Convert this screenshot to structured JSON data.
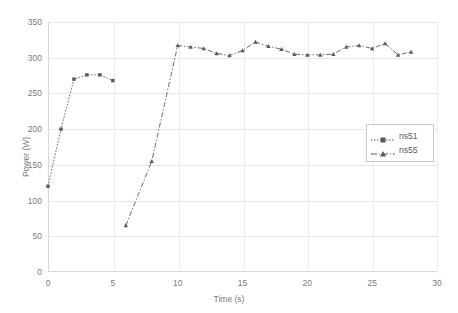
{
  "chart_data": {
    "type": "line",
    "title": "",
    "xlabel": "Time (s)",
    "ylabel": "Power (W)",
    "xlim": [
      0,
      30
    ],
    "ylim": [
      0,
      350
    ],
    "xticks": [
      0,
      5,
      10,
      15,
      20,
      25,
      30
    ],
    "yticks": [
      0,
      50,
      100,
      150,
      200,
      250,
      300,
      350
    ],
    "grid": true,
    "legend_position": "center-right",
    "series": [
      {
        "name": "ns51",
        "color": "#595959",
        "linestyle": "dotted",
        "marker": "square",
        "x": [
          0,
          1,
          2,
          3,
          4,
          5
        ],
        "values": [
          120,
          200,
          270,
          276,
          276,
          268
        ]
      },
      {
        "name": "ns55",
        "color": "#595959",
        "linestyle": "dash-dot",
        "marker": "triangle",
        "x": [
          6,
          8,
          10,
          11,
          12,
          13,
          14,
          15,
          16,
          17,
          18,
          19,
          20,
          21,
          22,
          23,
          24,
          25,
          26,
          27,
          28
        ],
        "values": [
          65,
          155,
          317,
          315,
          313,
          306,
          303,
          310,
          322,
          316,
          312,
          305,
          304,
          304,
          305,
          315,
          317,
          313,
          320,
          304,
          308
        ]
      }
    ]
  },
  "axes": {
    "yticks_labels": [
      "0",
      "50",
      "100",
      "150",
      "200",
      "250",
      "300",
      "350"
    ],
    "xticks_labels": [
      "0",
      "5",
      "10",
      "15",
      "20",
      "25",
      "30"
    ],
    "ylabel_text": "Power (W)",
    "xlabel_text": "Time (s)"
  },
  "legend": {
    "entries": [
      {
        "label": "ns51"
      },
      {
        "label": "ns55"
      }
    ]
  },
  "colors": {
    "line": "#595959",
    "grid": "#e6e6e6",
    "axis": "#d9d9d9",
    "tick_text": "#7a7a7a",
    "legend_border": "#c9c9c9",
    "background": "#ffffff"
  }
}
